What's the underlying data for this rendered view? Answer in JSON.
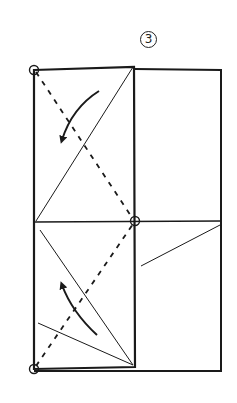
{
  "diagram": {
    "type": "origami-fold-instruction",
    "step_number": "3",
    "colors": {
      "ink": "#1a1a1a",
      "background": "#ffffff"
    },
    "paper": {
      "outline": {
        "x1": 34,
        "y1": 67,
        "x2": 221,
        "y2": 371
      },
      "folded_flap": {
        "x1": 34,
        "y1": 67,
        "x2": 135,
        "y2": 367
      },
      "midline_y": 221
    },
    "reference_points": [
      {
        "name": "top-left-corner",
        "x": 34,
        "y": 70
      },
      {
        "name": "center-point",
        "x": 135,
        "y": 221
      },
      {
        "name": "bottom-left-corner",
        "x": 34,
        "y": 369
      }
    ],
    "crease_lines": [
      {
        "name": "upper-diagonal-crease",
        "x1": 36,
        "y1": 221,
        "x2": 133,
        "y2": 67
      },
      {
        "name": "lower-diagonal-crease-long",
        "x1": 40,
        "y1": 230,
        "x2": 133,
        "y2": 365
      },
      {
        "name": "lower-diagonal-crease-short",
        "x1": 38,
        "y1": 323,
        "x2": 133,
        "y2": 365
      },
      {
        "name": "right-panel-crease",
        "x1": 141,
        "y1": 266,
        "x2": 220,
        "y2": 225
      }
    ],
    "valley_fold_lines": [
      {
        "name": "upper-valley-fold",
        "x1": 36,
        "y1": 72,
        "x2": 133,
        "y2": 219
      },
      {
        "name": "lower-valley-fold",
        "x1": 36,
        "y1": 366,
        "x2": 133,
        "y2": 224
      }
    ],
    "arrows": [
      {
        "name": "upper-fold-arrow",
        "direction": "down-left",
        "path": "M99,91 Q72,108 62,140"
      },
      {
        "name": "lower-fold-arrow",
        "direction": "up-left",
        "path": "M97,335 Q72,312 62,285"
      }
    ]
  }
}
